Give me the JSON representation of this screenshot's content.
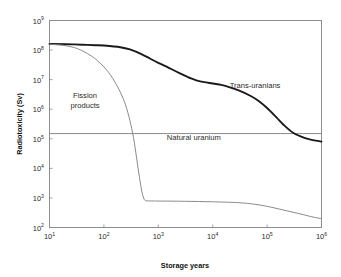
{
  "chart_data": {
    "type": "line",
    "title": "",
    "xlabel": "Storage years",
    "ylabel": "Radiotoxicity (Sv)",
    "xscale": "log",
    "yscale": "log",
    "xlim": [
      10,
      1000000
    ],
    "ylim": [
      100,
      1000000000
    ],
    "grid": false,
    "legend_position": "inline-annotations",
    "xticks": [
      {
        "value": 10,
        "label": "10",
        "exp": "1"
      },
      {
        "value": 100,
        "label": "10",
        "exp": "2"
      },
      {
        "value": 1000,
        "label": "10",
        "exp": "3"
      },
      {
        "value": 10000,
        "label": "10",
        "exp": "4"
      },
      {
        "value": 100000,
        "label": "10",
        "exp": "5"
      },
      {
        "value": 1000000,
        "label": "10",
        "exp": "6"
      }
    ],
    "yticks": [
      {
        "value": 100,
        "label": "10",
        "exp": "2"
      },
      {
        "value": 1000,
        "label": "10",
        "exp": "3"
      },
      {
        "value": 10000,
        "label": "10",
        "exp": "4"
      },
      {
        "value": 100000,
        "label": "10",
        "exp": "5"
      },
      {
        "value": 1000000,
        "label": "10",
        "exp": "6"
      },
      {
        "value": 10000000,
        "label": "10",
        "exp": "7"
      },
      {
        "value": 100000000,
        "label": "10",
        "exp": "8"
      },
      {
        "value": 1000000000,
        "label": "10",
        "exp": "9"
      }
    ],
    "series": [
      {
        "name": "Trans-uranians",
        "color": "#1a1a1a",
        "width": "thick",
        "label_x": 60000,
        "label_y": 5200000,
        "points": [
          [
            10,
            160000000
          ],
          [
            20,
            158000000
          ],
          [
            40,
            152000000
          ],
          [
            70,
            146000000
          ],
          [
            100,
            142000000
          ],
          [
            200,
            125000000
          ],
          [
            300,
            105000000
          ],
          [
            500,
            72000000
          ],
          [
            700,
            52000000
          ],
          [
            1000,
            37000000
          ],
          [
            1500,
            26000000
          ],
          [
            2000,
            20000000
          ],
          [
            3000,
            14000000
          ],
          [
            4000,
            11000000
          ],
          [
            5000,
            9500000
          ],
          [
            7000,
            8200000
          ],
          [
            10000,
            7400000
          ],
          [
            15000,
            6500000
          ],
          [
            20000,
            5600000
          ],
          [
            30000,
            4300000
          ],
          [
            50000,
            2800000
          ],
          [
            70000,
            1900000
          ],
          [
            100000,
            1100000
          ],
          [
            150000,
            520000
          ],
          [
            200000,
            300000
          ],
          [
            300000,
            160000
          ],
          [
            500000,
            105000
          ],
          [
            700000,
            90000
          ],
          [
            1000000,
            80000
          ]
        ]
      },
      {
        "name": "Fission products",
        "color": "#8a8a8a",
        "width": "thin",
        "label_x": 45,
        "label_y": 2400000,
        "label_line1": "Fission",
        "label_line2": "products",
        "points": [
          [
            10,
            158000000
          ],
          [
            15,
            150000000
          ],
          [
            20,
            140000000
          ],
          [
            30,
            118000000
          ],
          [
            40,
            95000000
          ],
          [
            50,
            76000000
          ],
          [
            70,
            50000000
          ],
          [
            100,
            27000000
          ],
          [
            130,
            15000000
          ],
          [
            160,
            8200000
          ],
          [
            200,
            3800000
          ],
          [
            250,
            1400000
          ],
          [
            300,
            420000
          ],
          [
            350,
            110000
          ],
          [
            400,
            22000
          ],
          [
            450,
            5000
          ],
          [
            500,
            1600
          ],
          [
            550,
            900
          ],
          [
            600,
            800
          ],
          [
            800,
            790
          ],
          [
            1000,
            785
          ],
          [
            3000,
            770
          ],
          [
            10000,
            740
          ],
          [
            30000,
            690
          ],
          [
            60000,
            610
          ],
          [
            100000,
            520
          ],
          [
            200000,
            390
          ],
          [
            400000,
            290
          ],
          [
            700000,
            225
          ],
          [
            1000000,
            200
          ]
        ]
      }
    ],
    "reference_lines": [
      {
        "name": "Natural uranium",
        "label": "Natural uranium",
        "value": 150000,
        "color": "#8a8a8a",
        "label_x": 4500,
        "label_y": 90000
      }
    ]
  }
}
